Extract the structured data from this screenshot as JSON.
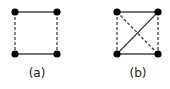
{
  "figures": [
    {
      "label": "(a)",
      "label_pos": [
        37,
        66
      ],
      "nodes": [
        [
          15,
          12
        ],
        [
          57,
          12
        ],
        [
          15,
          54
        ],
        [
          57,
          54
        ]
      ],
      "edges": [
        {
          "from": 0,
          "to": 1,
          "style": "solid"
        },
        {
          "from": 2,
          "to": 3,
          "style": "solid"
        },
        {
          "from": 0,
          "to": 2,
          "style": "dashed"
        },
        {
          "from": 1,
          "to": 3,
          "style": "dashed"
        }
      ]
    },
    {
      "label": "(b)",
      "label_pos": [
        138,
        66
      ],
      "nodes": [
        [
          117,
          12
        ],
        [
          158,
          12
        ],
        [
          117,
          54
        ],
        [
          158,
          54
        ]
      ],
      "edges": [
        {
          "from": 0,
          "to": 1,
          "style": "solid"
        },
        {
          "from": 2,
          "to": 3,
          "style": "solid"
        },
        {
          "from": 2,
          "to": 1,
          "style": "solid"
        },
        {
          "from": 0,
          "to": 2,
          "style": "dashed"
        },
        {
          "from": 1,
          "to": 3,
          "style": "dashed"
        },
        {
          "from": 0,
          "to": 3,
          "style": "dashed"
        }
      ]
    }
  ],
  "colors": {
    "edge": "#444444",
    "node": "#000000"
  }
}
